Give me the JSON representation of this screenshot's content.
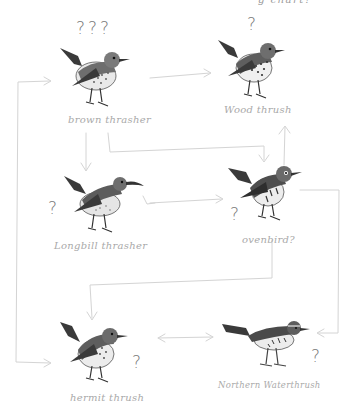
{
  "header_fragment": "g chart?",
  "colors": {
    "pencil_line": "#d4d4d4",
    "label_text": "#a9a9a9",
    "question_mark": "#7a7a7a",
    "bird_dark": "#3a3a3a",
    "bird_mid": "#6e6e6e",
    "bird_light": "#e9e9e9"
  },
  "nodes": [
    {
      "id": "brown-thrasher",
      "label": "brown thrasher",
      "question": "???"
    },
    {
      "id": "wood-thrush",
      "label": "Wood thrush",
      "question": "?"
    },
    {
      "id": "longbill-thrasher",
      "label": "Longbill thrasher",
      "question": "?"
    },
    {
      "id": "ovenbird",
      "label": "ovenbird?",
      "question": "?"
    },
    {
      "id": "hermit-thrush",
      "label": "hermit thrush",
      "question": "?"
    },
    {
      "id": "northern-waterthrush",
      "label": "Northern Waterthrush",
      "question": "?"
    }
  ],
  "edges": [
    {
      "from": "brown-thrasher",
      "to": "wood-thrush",
      "type": "arrow"
    },
    {
      "from": "brown-thrasher",
      "to": "longbill-thrasher",
      "type": "arrow"
    },
    {
      "from": "brown-thrasher",
      "to": "ovenbird",
      "type": "arrow"
    },
    {
      "from": "ovenbird",
      "to": "wood-thrush",
      "type": "arrow"
    },
    {
      "from": "longbill-thrasher",
      "to": "ovenbird",
      "type": "arrow"
    },
    {
      "from": "ovenbird",
      "to": "hermit-thrush",
      "type": "arrow"
    },
    {
      "from": "hermit-thrush",
      "to": "northern-waterthrush",
      "type": "bidirectional"
    },
    {
      "from": "ovenbird",
      "to": "northern-waterthrush",
      "type": "arrow"
    },
    {
      "from": "hermit-thrush",
      "to": "brown-thrasher",
      "type": "bidirectional-loop"
    }
  ]
}
